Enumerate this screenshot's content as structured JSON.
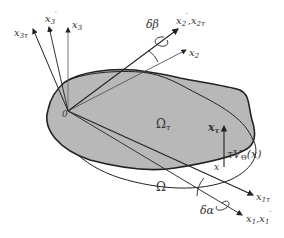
{
  "diagram": {
    "colors": {
      "shaded_region": "#b8b8b8",
      "stroke": "#222222",
      "label": "#333333"
    },
    "labels": {
      "origin": "0",
      "x3": "x",
      "x3_sub": "3",
      "x3prime": "x",
      "x3prime_sub": "3",
      "x3prime_mark": "′",
      "x3tau": "x",
      "x3tau_sub": "3τ",
      "x2": "x",
      "x2_sub": "2",
      "x2prime_x2tau": "x",
      "x2prime_sub": "2",
      "x2prime_mark": "′",
      "x2tau": "x",
      "x2tau_sub": "2τ",
      "delta_beta": "δβ",
      "delta_alpha": "δα",
      "omega_tau": "Ω",
      "omega_tau_sub": "τ",
      "omega": "Ω",
      "x_tau": "x",
      "x_tau_sub": "τ",
      "x": "x",
      "tau_V": "τV",
      "tau_V_sub": "Θ",
      "tau_V_arg": "(x)",
      "x1tau": "x",
      "x1tau_sub": "1τ",
      "x1_x1prime": "x",
      "x1_sub": "1",
      "x1prime_sub": "1",
      "x1prime_mark": "′",
      "comma": ","
    }
  }
}
